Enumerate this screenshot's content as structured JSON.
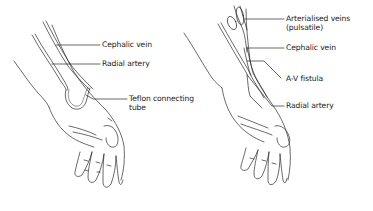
{
  "figure": {
    "colors": {
      "line": "#2a2a2a",
      "background": "#ffffff"
    },
    "panels": [
      {
        "id": "left",
        "description": "Forearm graft with Teflon connecting tube",
        "labels": [
          {
            "text": "Cephalic vein"
          },
          {
            "text": "Radial artery"
          },
          {
            "text": "Teflon connecting",
            "text2": "tube"
          }
        ]
      },
      {
        "id": "right",
        "description": "Radial-cephalic A-V fistula",
        "labels": [
          {
            "text": "Arterialised veins",
            "text2": "(pulsatile)"
          },
          {
            "text": "Cephalic vein"
          },
          {
            "text": "A-V fistula"
          },
          {
            "text": "Radial artery"
          }
        ]
      }
    ]
  }
}
